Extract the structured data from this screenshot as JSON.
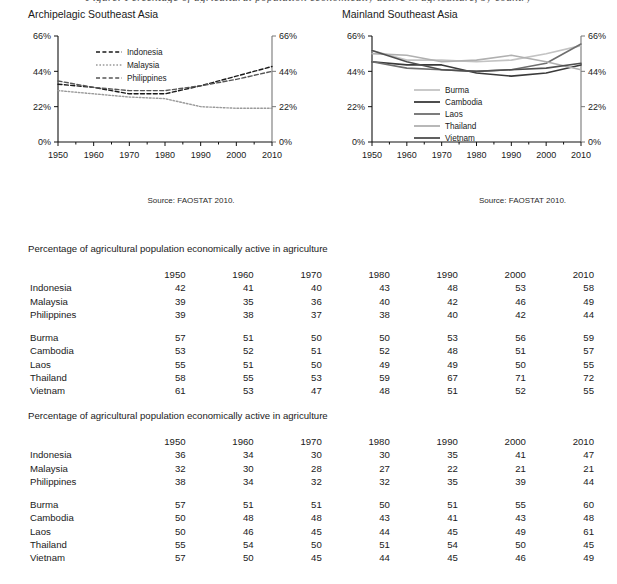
{
  "top_caption": "Figure: Percentage of agricultural population economically active in agriculture, by country",
  "charts": [
    {
      "key": "archipelagic",
      "title": "Archipelagic Southeast Asia",
      "source": "Source: FAOSTAT 2010.",
      "axis": {
        "y_ticks": [
          "0%",
          "22%",
          "44%",
          "66%"
        ],
        "x_ticks": [
          "1950",
          "1960",
          "1970",
          "1980",
          "1990",
          "2000",
          "2010"
        ]
      },
      "legend": [
        "Indonesia",
        "Malaysia",
        "Philippines"
      ]
    },
    {
      "key": "mainland",
      "title": "Mainland Southeast Asia",
      "source": "Source: FAOSTAT 2010.",
      "axis": {
        "y_ticks": [
          "0%",
          "22%",
          "44%",
          "66%"
        ],
        "x_ticks": [
          "1950",
          "1960",
          "1970",
          "1980",
          "1990",
          "2000",
          "2010"
        ]
      },
      "legend": [
        "Burma",
        "Cambodia",
        "Laos",
        "Thailand",
        "Vietnam"
      ]
    }
  ],
  "chart_data": [
    {
      "type": "line",
      "title": "Archipelagic Southeast Asia",
      "xlabel": "",
      "ylabel": "",
      "x": [
        1950,
        1960,
        1970,
        1980,
        1990,
        2000,
        2010
      ],
      "ylim": [
        0,
        66
      ],
      "yticks": [
        0,
        22,
        44,
        66
      ],
      "ytick_labels": [
        "0%",
        "22%",
        "44%",
        "66%"
      ],
      "grid": false,
      "legend_position": "upper-left-inside",
      "annotations": [
        "Source: FAOSTAT 2010."
      ],
      "series": [
        {
          "name": "Indonesia",
          "values": [
            36,
            34,
            30,
            30,
            35,
            41,
            47
          ],
          "style": "dashed",
          "color": "#1a1a1a"
        },
        {
          "name": "Malaysia",
          "values": [
            32,
            30,
            28,
            27,
            22,
            21,
            21
          ],
          "style": "dotted",
          "color": "#9a9a9a"
        },
        {
          "name": "Philippines",
          "values": [
            38,
            34,
            32,
            32,
            35,
            39,
            44
          ],
          "style": "dashed",
          "color": "#555555"
        }
      ]
    },
    {
      "type": "line",
      "title": "Mainland Southeast Asia",
      "xlabel": "",
      "ylabel": "",
      "x": [
        1950,
        1960,
        1970,
        1980,
        1990,
        2000,
        2010
      ],
      "ylim": [
        0,
        66
      ],
      "yticks": [
        0,
        22,
        44,
        66
      ],
      "ytick_labels": [
        "0%",
        "22%",
        "44%",
        "66%"
      ],
      "grid": false,
      "legend_position": "lower-left-inside",
      "annotations": [
        "Source: FAOSTAT 2010."
      ],
      "series": [
        {
          "name": "Burma",
          "values": [
            57,
            51,
            51,
            50,
            51,
            55,
            60
          ],
          "style": "solid",
          "color": "#c3c3c3"
        },
        {
          "name": "Cambodia",
          "values": [
            50,
            48,
            48,
            43,
            41,
            43,
            48
          ],
          "style": "solid",
          "color": "#3a3a3a"
        },
        {
          "name": "Laos",
          "values": [
            50,
            46,
            45,
            44,
            45,
            49,
            61
          ],
          "style": "solid",
          "color": "#6e6e6e"
        },
        {
          "name": "Thailand",
          "values": [
            55,
            54,
            50,
            51,
            54,
            50,
            45
          ],
          "style": "solid",
          "color": "#b0b0b0"
        },
        {
          "name": "Vietnam",
          "values": [
            57,
            50,
            45,
            44,
            45,
            46,
            49
          ],
          "style": "solid",
          "color": "#4f4f4f"
        }
      ]
    }
  ],
  "tables": [
    {
      "caption": "Percentage of agricultural population economically active in agriculture",
      "corner": "",
      "years": [
        "1950",
        "1960",
        "1970",
        "1980",
        "1990",
        "2000",
        "2010"
      ],
      "group_a": [
        {
          "label": "Indonesia",
          "values": [
            "42",
            "41",
            "40",
            "43",
            "48",
            "53",
            "58"
          ]
        },
        {
          "label": "Malaysia",
          "values": [
            "39",
            "35",
            "36",
            "40",
            "42",
            "46",
            "49"
          ]
        },
        {
          "label": "Philippines",
          "values": [
            "39",
            "38",
            "37",
            "38",
            "40",
            "42",
            "44"
          ]
        }
      ],
      "group_b": [
        {
          "label": "Burma",
          "values": [
            "57",
            "51",
            "50",
            "50",
            "53",
            "56",
            "59"
          ]
        },
        {
          "label": "Cambodia",
          "values": [
            "53",
            "52",
            "51",
            "52",
            "48",
            "51",
            "57"
          ]
        },
        {
          "label": "Laos",
          "values": [
            "55",
            "51",
            "50",
            "49",
            "49",
            "50",
            "55"
          ]
        },
        {
          "label": "Thailand",
          "values": [
            "58",
            "55",
            "53",
            "59",
            "67",
            "71",
            "72"
          ]
        },
        {
          "label": "Vietnam",
          "values": [
            "61",
            "53",
            "47",
            "48",
            "51",
            "52",
            "55"
          ]
        }
      ]
    },
    {
      "caption": "Percentage of agricultural population economically active in agriculture",
      "corner": "",
      "years": [
        "1950",
        "1960",
        "1970",
        "1980",
        "1990",
        "2000",
        "2010"
      ],
      "group_a": [
        {
          "label": "Indonesia",
          "values": [
            "36",
            "34",
            "30",
            "30",
            "35",
            "41",
            "47"
          ]
        },
        {
          "label": "Malaysia",
          "values": [
            "32",
            "30",
            "28",
            "27",
            "22",
            "21",
            "21"
          ]
        },
        {
          "label": "Philippines",
          "values": [
            "38",
            "34",
            "32",
            "32",
            "35",
            "39",
            "44"
          ]
        }
      ],
      "group_b": [
        {
          "label": "Burma",
          "values": [
            "57",
            "51",
            "51",
            "50",
            "51",
            "55",
            "60"
          ]
        },
        {
          "label": "Cambodia",
          "values": [
            "50",
            "48",
            "48",
            "43",
            "41",
            "43",
            "48"
          ]
        },
        {
          "label": "Laos",
          "values": [
            "50",
            "46",
            "45",
            "44",
            "45",
            "49",
            "61"
          ]
        },
        {
          "label": "Thailand",
          "values": [
            "55",
            "54",
            "50",
            "51",
            "54",
            "50",
            "45"
          ]
        },
        {
          "label": "Vietnam",
          "values": [
            "57",
            "50",
            "45",
            "44",
            "45",
            "46",
            "49"
          ]
        }
      ]
    }
  ]
}
